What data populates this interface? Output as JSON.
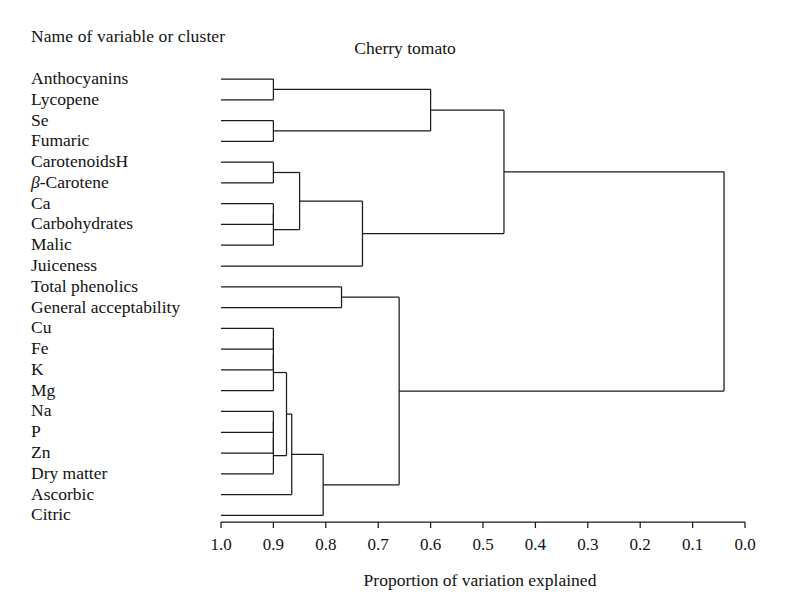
{
  "header": {
    "column_header": "Name of variable or cluster",
    "title": "Cherry tomato"
  },
  "axis": {
    "label": "Proportion of variation explained",
    "ticks": [
      "1.0",
      "0.9",
      "0.8",
      "0.7",
      "0.6",
      "0.5",
      "0.4",
      "0.3",
      "0.2",
      "0.1",
      "0.0"
    ]
  },
  "labels": {
    "anthocyanins": "Anthocyanins",
    "lycopene": "Lycopene",
    "se": "Se",
    "fumaric": "Fumaric",
    "carotenoidsh": "CarotenoidsH",
    "beta_carotene_prefix": "β",
    "beta_carotene_rest": "-Carotene",
    "ca": "Ca",
    "carbohydrates": "Carbohydrates",
    "malic": "Malic",
    "juiceness": "Juiceness",
    "total_phenolics": "Total phenolics",
    "general_acceptability": "General acceptability",
    "cu": "Cu",
    "fe": "Fe",
    "k": "K",
    "mg": "Mg",
    "na": "Na",
    "p": "P",
    "zn": "Zn",
    "dry_matter": "Dry matter",
    "ascorbic": "Ascorbic",
    "citric": "Citric"
  },
  "chart_data": {
    "type": "dendrogram",
    "title": "Cherry tomato",
    "xlabel": "Proportion of variation explained",
    "ylabel": "Name of variable or cluster",
    "xlim": [
      1.0,
      0.0
    ],
    "x_axis_reversed": true,
    "xticks": [
      1.0,
      0.9,
      0.8,
      0.7,
      0.6,
      0.5,
      0.4,
      0.3,
      0.2,
      0.1,
      0.0
    ],
    "grid": false,
    "legend": false,
    "leaves": [
      "Anthocyanins",
      "Lycopene",
      "Se",
      "Fumaric",
      "CarotenoidsH",
      "β-Carotene",
      "Ca",
      "Carbohydrates",
      "Malic",
      "Juiceness",
      "Total phenolics",
      "General acceptability",
      "Cu",
      "Fe",
      "K",
      "Mg",
      "Na",
      "P",
      "Zn",
      "Dry matter",
      "Ascorbic",
      "Citric"
    ],
    "leaf_start_value": 1.0,
    "merges": [
      {
        "id": "n1",
        "children": [
          "Anthocyanins",
          "Lycopene"
        ],
        "value": 0.9
      },
      {
        "id": "n2",
        "children": [
          "Se",
          "Fumaric"
        ],
        "value": 0.9
      },
      {
        "id": "n3",
        "children": [
          "n1",
          "n2"
        ],
        "value": 0.6
      },
      {
        "id": "n4",
        "children": [
          "CarotenoidsH",
          "β-Carotene"
        ],
        "value": 0.9
      },
      {
        "id": "n5",
        "children": [
          "Ca",
          "Carbohydrates"
        ],
        "value": 0.9
      },
      {
        "id": "n6",
        "children": [
          "n5",
          "Malic"
        ],
        "value": 0.9
      },
      {
        "id": "n7",
        "children": [
          "n4",
          "n6"
        ],
        "value": 0.85
      },
      {
        "id": "n8",
        "children": [
          "n7",
          "Juiceness"
        ],
        "value": 0.73
      },
      {
        "id": "n9",
        "children": [
          "n3",
          "n8"
        ],
        "value": 0.46
      },
      {
        "id": "n10",
        "children": [
          "Total phenolics",
          "General acceptability"
        ],
        "value": 0.77
      },
      {
        "id": "n11",
        "children": [
          "Cu",
          "Fe"
        ],
        "value": 0.9
      },
      {
        "id": "n12",
        "children": [
          "n11",
          "K"
        ],
        "value": 0.9
      },
      {
        "id": "n13",
        "children": [
          "n12",
          "Mg"
        ],
        "value": 0.9
      },
      {
        "id": "n14",
        "children": [
          "Na",
          "P"
        ],
        "value": 0.9
      },
      {
        "id": "n15",
        "children": [
          "n14",
          "Zn"
        ],
        "value": 0.9
      },
      {
        "id": "n16",
        "children": [
          "n15",
          "Dry matter"
        ],
        "value": 0.9
      },
      {
        "id": "n17",
        "children": [
          "n13",
          "n16"
        ],
        "value": 0.875
      },
      {
        "id": "n18",
        "children": [
          "n17",
          "Ascorbic"
        ],
        "value": 0.865
      },
      {
        "id": "n19",
        "children": [
          "n18",
          "Citric"
        ],
        "value": 0.805
      },
      {
        "id": "n20",
        "children": [
          "n10",
          "n19"
        ],
        "value": 0.66
      },
      {
        "id": "n21",
        "children": [
          "n9",
          "n20"
        ],
        "value": 0.04
      }
    ]
  }
}
